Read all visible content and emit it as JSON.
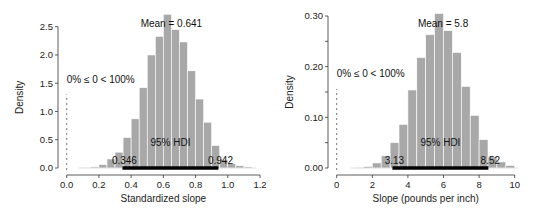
{
  "chart_data": [
    {
      "type": "bar",
      "subtype": "histogram",
      "title": "",
      "xlabel": "Standardized slope",
      "ylabel": "Density",
      "xlim": [
        0.0,
        1.2
      ],
      "ylim": [
        0.0,
        2.5
      ],
      "x_ticks": [
        "0.0",
        "0.2",
        "0.4",
        "0.6",
        "0.8",
        "1.0",
        "1.2"
      ],
      "y_ticks": [
        "0.0",
        "0.5",
        "1.0",
        "1.5",
        "2.0",
        "2.5"
      ],
      "bin_width": 0.05,
      "bin_starts": [
        0.1,
        0.15,
        0.2,
        0.25,
        0.3,
        0.35,
        0.4,
        0.45,
        0.5,
        0.55,
        0.6,
        0.65,
        0.7,
        0.75,
        0.8,
        0.85,
        0.9,
        0.95,
        1.0,
        1.05,
        1.1
      ],
      "values": [
        0.01,
        0.02,
        0.06,
        0.16,
        0.28,
        0.54,
        0.87,
        1.42,
        2.0,
        2.33,
        2.72,
        2.45,
        2.23,
        1.72,
        1.22,
        0.81,
        0.4,
        0.15,
        0.08,
        0.04,
        0.02
      ],
      "annotations": {
        "mean_label": "Mean = 0.641",
        "compare_label": "0% ≤ 0 < 100%",
        "compare_value": 0,
        "hdi_label": "95% HDI",
        "hdi_low": 0.346,
        "hdi_high": 0.942,
        "hdi_low_label": "0.346",
        "hdi_high_label": "0.942"
      },
      "grid": false,
      "legend": "none"
    },
    {
      "type": "bar",
      "subtype": "histogram",
      "title": "",
      "xlabel": "Slope (pounds per inch)",
      "ylabel": "Density",
      "xlim": [
        0,
        10
      ],
      "ylim": [
        0.0,
        0.3
      ],
      "x_ticks": [
        "0",
        "2",
        "4",
        "6",
        "8",
        "10"
      ],
      "y_ticks": [
        "0.00",
        "0.10",
        "0.20",
        "0.30"
      ],
      "y_minor_ticks": [
        0.05,
        0.15,
        0.25
      ],
      "bin_width": 0.5,
      "bin_starts": [
        1.0,
        1.5,
        2.0,
        2.5,
        3.0,
        3.5,
        4.0,
        4.5,
        5.0,
        5.5,
        6.0,
        6.5,
        7.0,
        7.5,
        8.0,
        8.5,
        9.0,
        9.5
      ],
      "values": [
        0.001,
        0.003,
        0.01,
        0.024,
        0.05,
        0.086,
        0.154,
        0.218,
        0.263,
        0.305,
        0.271,
        0.228,
        0.161,
        0.104,
        0.056,
        0.022,
        0.012,
        0.005
      ],
      "annotations": {
        "mean_label": "Mean = 5.8",
        "compare_label": "0% ≤ 0 < 100%",
        "compare_value": 0,
        "hdi_label": "95% HDI",
        "hdi_low": 3.13,
        "hdi_high": 8.52,
        "hdi_low_label": "3.13",
        "hdi_high_label": "8.52"
      },
      "grid": false,
      "legend": "none"
    }
  ],
  "layout": {
    "panels": [
      {
        "x0px": 66.7,
        "x1px": 260,
        "y0px": 168,
        "y1px": 26.7,
        "yaxis_x": 58,
        "xaxis_y": 175
      },
      {
        "x0px": 336.7,
        "x1px": 514.7,
        "y0px": 168,
        "y1px": 16,
        "yaxis_x": 328,
        "xaxis_y": 175
      }
    ]
  }
}
